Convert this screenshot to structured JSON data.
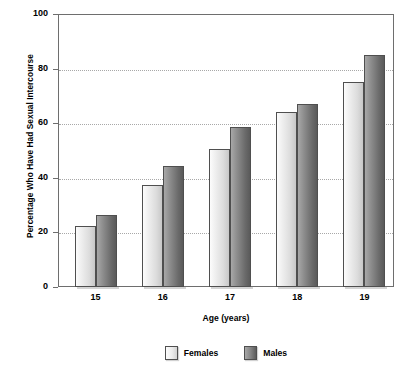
{
  "chart_data": {
    "type": "bar",
    "title": "",
    "xlabel": "Age (years)",
    "ylabel": "Percentage Who Have Had Sexual Intercourse",
    "categories": [
      "15",
      "16",
      "17",
      "18",
      "19"
    ],
    "series": [
      {
        "name": "Females",
        "color": "#e8e8e8",
        "values": [
          22.5,
          37.5,
          50.5,
          64,
          75
        ]
      },
      {
        "name": "Males",
        "color": "#777777",
        "values": [
          26.5,
          44.5,
          58.5,
          67,
          85
        ]
      }
    ],
    "ylim": [
      0,
      100
    ],
    "yticks": [
      "0",
      "20",
      "40",
      "60",
      "80",
      "100"
    ],
    "grid": "horizontal-dotted",
    "legend_position": "bottom-center"
  },
  "axis": {
    "y_title": "Percentage Who Have Had Sexual Intercourse",
    "x_title": "Age (years)"
  },
  "colors": {
    "axis_line": "#6e6e6e",
    "gridline": "#a8a8a8",
    "bar_border": "#4f4f4f",
    "text": "#000000"
  }
}
